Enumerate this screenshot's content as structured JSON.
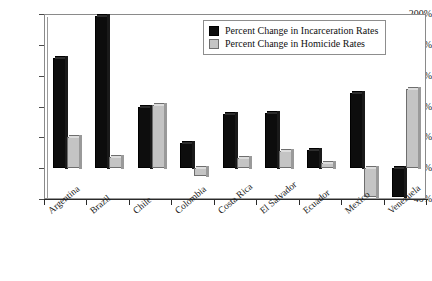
{
  "chart_data": {
    "type": "bar",
    "title": "",
    "subtitle": "",
    "xlabel": "",
    "ylabel": "",
    "ylim": [
      -40,
      200
    ],
    "ytick_labels": [
      "200%",
      "160%",
      "120%",
      "80%",
      "40%",
      "0%",
      "-40%"
    ],
    "ytick_values": [
      200,
      160,
      120,
      80,
      40,
      0,
      -40
    ],
    "grid": true,
    "legend_position": "top-right",
    "categories": [
      "Argentina",
      "Brazil",
      "Chile",
      "Colombia",
      "Costa Rica",
      "El Salvador",
      "Ecuador",
      "Mexico",
      "Venezuela"
    ],
    "series": [
      {
        "name": "Percent Change in Incarceration Rates",
        "color": "#0d0d0d",
        "values": [
          143,
          197,
          79,
          33,
          70,
          72,
          24,
          98,
          -38
        ]
      },
      {
        "name": "Percent Change in Homicide Rates",
        "color": "#c4c4c4",
        "values": [
          40,
          15,
          82,
          -10,
          13,
          22,
          7,
          -38,
          103
        ]
      }
    ]
  },
  "legend": {
    "items": [
      {
        "label": "Percent Change in Incarceration Rates",
        "swatch": "black"
      },
      {
        "label": "Percent Change in Homicide Rates",
        "swatch": "gray"
      }
    ]
  }
}
